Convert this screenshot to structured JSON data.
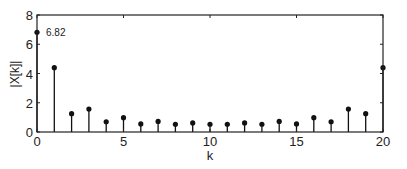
{
  "chart_data": {
    "type": "stem",
    "title": "",
    "xlabel": "k",
    "ylabel": "|X[k]|",
    "xlim": [
      0,
      20
    ],
    "ylim": [
      0,
      8
    ],
    "xticks": [
      0,
      5,
      10,
      15,
      20
    ],
    "yticks": [
      0,
      2,
      4,
      6,
      8
    ],
    "grid": false,
    "x": [
      0,
      1,
      2,
      3,
      4,
      5,
      6,
      7,
      8,
      9,
      10,
      11,
      12,
      13,
      14,
      15,
      16,
      17,
      18,
      19,
      20
    ],
    "values": [
      6.82,
      4.4,
      1.25,
      1.57,
      0.7,
      0.98,
      0.55,
      0.72,
      0.53,
      0.62,
      0.53,
      0.53,
      0.62,
      0.53,
      0.72,
      0.55,
      0.98,
      0.7,
      1.57,
      1.25,
      4.4
    ],
    "annotations": [
      {
        "x": 0,
        "y": 6.82,
        "text": "6.82"
      }
    ],
    "colors": {
      "stem": "#111111",
      "axis": "#222222",
      "background": "#ffffff"
    }
  },
  "labels": {
    "xlabel": "k",
    "ylabel": "|X[k]|",
    "annotation": "6.82"
  }
}
